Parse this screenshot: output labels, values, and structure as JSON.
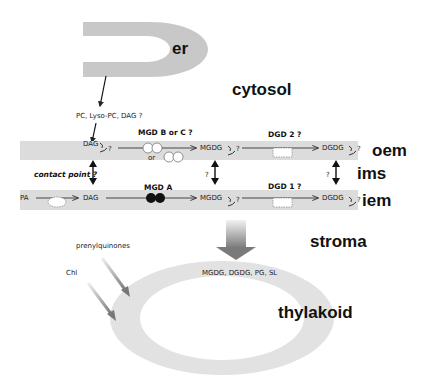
{
  "compartments": {
    "er": "er",
    "cytosol": "cytosol",
    "oem": "oem",
    "ims": "ims",
    "iem": "iem",
    "stroma": "stroma",
    "thylakoid": "thylakoid"
  },
  "er_export": "PC, Lyso-PC, DAG ?",
  "oem_row": {
    "dag": "DAG",
    "enzyme_1": "MGD B or C ?",
    "enzyme_1_alt": "or",
    "mgdg": "MGDG",
    "enzyme_2": "DGD 2 ?",
    "dgdg": "DGDG",
    "flip_q": "?"
  },
  "ims_row": {
    "contact_point": "contact point ?",
    "q_mgdg": "?",
    "q_dgdg": "?"
  },
  "iem_row": {
    "pa": "PA",
    "dag": "DAG",
    "enzyme_1": "MGD A",
    "mgdg": "MGDG",
    "enzyme_2": "DGD 1 ?",
    "dgdg": "DGDG",
    "flip_q": "?"
  },
  "thylakoid_inputs": {
    "lipids": "MGDG, DGDG, PG, SL",
    "prenylquinones": "prenylquinones",
    "chl": "Chl"
  },
  "colors": {
    "membrane": "#dcdcdc",
    "ring": "#e2e2e2",
    "enzyme_filled": "#111111",
    "arrow": "#333333"
  }
}
